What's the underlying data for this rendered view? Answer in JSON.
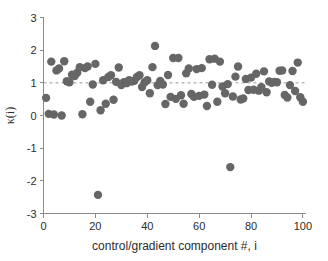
{
  "chart_data": {
    "type": "scatter",
    "title": "",
    "xlabel": "control/gradient component #, i",
    "ylabel": "κ(i)",
    "xlim": [
      0,
      101
    ],
    "ylim": [
      -3,
      3
    ],
    "xticks": [
      0,
      20,
      40,
      60,
      80,
      100
    ],
    "yticks": [
      -3,
      -2,
      -1,
      0,
      1,
      2,
      3
    ],
    "xticklabels": [
      "0",
      "20",
      "40",
      "60",
      "80",
      "100"
    ],
    "yticklabels": [
      "-3",
      "-2",
      "-1",
      "0",
      "1",
      "2",
      "3"
    ],
    "grid": false,
    "legend": false,
    "marker_color": "#666666",
    "marker_size": 4.2,
    "axis_color": "#8a8a8a",
    "reference_line": {
      "y": 1.0,
      "style": "dashed",
      "color": "#9a9a9a"
    },
    "series": [
      {
        "name": "kappa(i)",
        "x": [
          1,
          2,
          3,
          4,
          5,
          6,
          7,
          8,
          9,
          10,
          11,
          12,
          13,
          14,
          15,
          16,
          17,
          18,
          19,
          20,
          21,
          22,
          23,
          24,
          25,
          26,
          27,
          28,
          29,
          30,
          31,
          32,
          33,
          34,
          35,
          36,
          37,
          38,
          39,
          40,
          41,
          42,
          43,
          44,
          45,
          46,
          47,
          48,
          49,
          50,
          51,
          52,
          53,
          54,
          55,
          56,
          57,
          58,
          59,
          60,
          61,
          62,
          63,
          64,
          65,
          66,
          67,
          68,
          69,
          70,
          71,
          72,
          73,
          74,
          75,
          76,
          77,
          78,
          79,
          80,
          81,
          82,
          83,
          84,
          85,
          86,
          87,
          88,
          89,
          90,
          91,
          92,
          93,
          94,
          95,
          96,
          97,
          98,
          99,
          100
        ],
        "y": [
          0.54,
          0.05,
          1.65,
          0.03,
          1.38,
          1.44,
          0.0,
          1.66,
          1.05,
          1.02,
          1.25,
          1.21,
          1.31,
          1.48,
          0.04,
          1.45,
          1.5,
          0.42,
          0.95,
          1.58,
          -2.43,
          0.16,
          1.08,
          0.36,
          1.18,
          1.23,
          0.48,
          1.03,
          1.47,
          0.93,
          1.02,
          0.99,
          1.08,
          1.04,
          1.06,
          1.18,
          1.23,
          0.87,
          1.02,
          1.08,
          0.68,
          1.48,
          2.13,
          0.93,
          1.06,
          0.95,
          0.35,
          1.24,
          0.57,
          1.76,
          0.51,
          1.76,
          0.62,
          0.36,
          1.29,
          1.44,
          0.66,
          0.57,
          1.42,
          0.6,
          1.45,
          0.64,
          0.29,
          1.72,
          0.94,
          1.74,
          0.42,
          1.65,
          0.89,
          0.68,
          0.96,
          -1.58,
          0.58,
          1.19,
          1.5,
          0.49,
          0.52,
          1.12,
          0.78,
          1.16,
          0.79,
          1.28,
          0.76,
          0.87,
          1.35,
          0.71,
          1.04,
          1.0,
          1.03,
          1.02,
          1.37,
          1.38,
          0.63,
          0.55,
          0.93,
          1.36,
          0.75,
          1.62,
          0.56,
          0.42
        ]
      }
    ]
  },
  "axes": {
    "x_label": "control/gradient component #, i",
    "y_label": "κ(i)"
  }
}
